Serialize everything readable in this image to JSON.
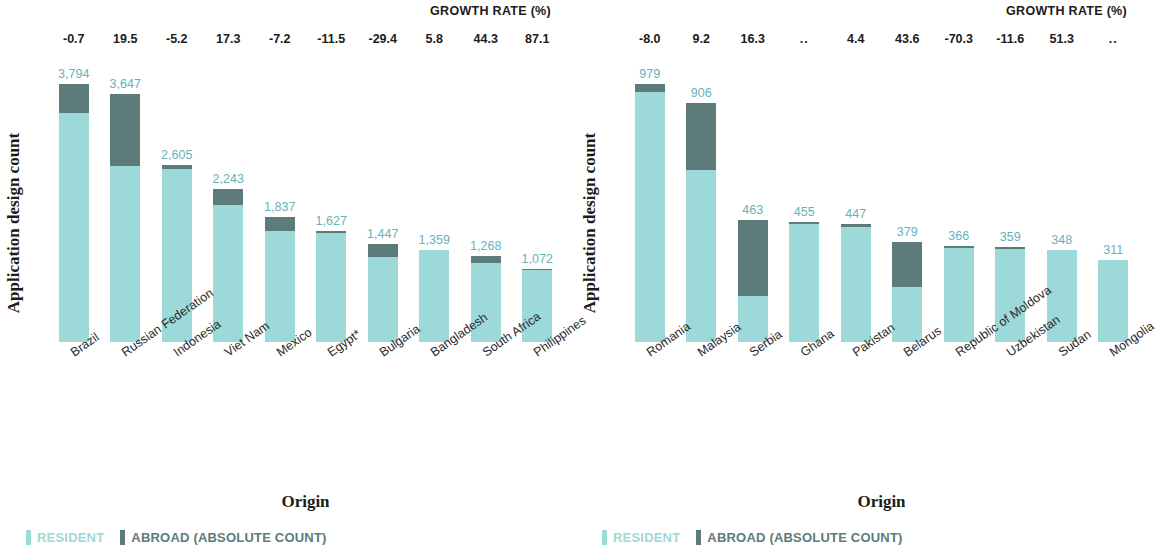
{
  "colors": {
    "resident": "#9dd9d9",
    "abroad": "#5d7b7b",
    "value_label": "#66b2bb",
    "text": "#1b1b1b",
    "background": "#ffffff"
  },
  "legend": {
    "resident_label": "RESIDENT",
    "abroad_label": "ABROAD (ABSOLUTE COUNT)"
  },
  "axis": {
    "ylabel": "Application design count",
    "xlabel": "Origin",
    "growth_title": "GROWTH RATE (%)"
  },
  "chart_data": [
    {
      "type": "bar",
      "stacked": true,
      "panel": "left",
      "title": "",
      "xlabel": "Origin",
      "ylabel": "Application design count",
      "grid": false,
      "legend_position": "bottom-left",
      "ylim": [
        0,
        4000
      ],
      "annotation_row_label": "GROWTH RATE (%)",
      "categories": [
        "Brazil",
        "Russian Federation",
        "Indonesia",
        "Viet Nam",
        "Mexico",
        "Egypt*",
        "Bulgaria",
        "Bangladesh",
        "South Africa",
        "Philippines"
      ],
      "totals": [
        3794,
        3647,
        2605,
        2243,
        1837,
        1627,
        1447,
        1359,
        1268,
        1072
      ],
      "total_labels": [
        "3,794",
        "3,647",
        "2,605",
        "2,243",
        "1,837",
        "1,627",
        "1,447",
        "1,359",
        "1,268",
        "1,072"
      ],
      "growth_rates": [
        "-0.7",
        "19.5",
        "-5.2",
        "17.3",
        "-7.2",
        "-11.5",
        "-29.4",
        "5.8",
        "44.3",
        "87.1"
      ],
      "series": [
        {
          "name": "RESIDENT",
          "color": "#9dd9d9",
          "values": [
            3364,
            2592,
            2545,
            2018,
            1637,
            1597,
            1247,
            1349,
            1158,
            1052
          ]
        },
        {
          "name": "ABROAD (ABSOLUTE COUNT)",
          "color": "#5d7b7b",
          "values": [
            430,
            1055,
            60,
            225,
            200,
            30,
            200,
            10,
            110,
            20
          ]
        }
      ]
    },
    {
      "type": "bar",
      "stacked": true,
      "panel": "right",
      "title": "",
      "xlabel": "Origin",
      "ylabel": "Application design count",
      "grid": false,
      "legend_position": "bottom-left",
      "ylim": [
        0,
        1000
      ],
      "annotation_row_label": "GROWTH RATE (%)",
      "categories": [
        "Romania",
        "Malaysia",
        "Serbia",
        "Ghana",
        "Pakistan",
        "Belarus",
        "Republic of Moldova",
        "Uzbekistan",
        "Sudan",
        "Mongolia"
      ],
      "totals": [
        979,
        906,
        463,
        455,
        447,
        379,
        366,
        359,
        348,
        311
      ],
      "total_labels": [
        "979",
        "906",
        "463",
        "455",
        "447",
        "379",
        "366",
        "359",
        "348",
        "311"
      ],
      "growth_rates": [
        "-8.0",
        "9.2",
        "16.3",
        "..",
        "4.4",
        "43.6",
        "-70.3",
        "-11.6",
        "51.3",
        ".."
      ],
      "series": [
        {
          "name": "RESIDENT",
          "color": "#9dd9d9",
          "values": [
            949,
            652,
            176,
            447,
            435,
            209,
            358,
            352,
            348,
            311
          ]
        },
        {
          "name": "ABROAD (ABSOLUTE COUNT)",
          "color": "#5d7b7b",
          "values": [
            30,
            254,
            287,
            8,
            12,
            170,
            8,
            7,
            0,
            0
          ]
        }
      ]
    }
  ]
}
